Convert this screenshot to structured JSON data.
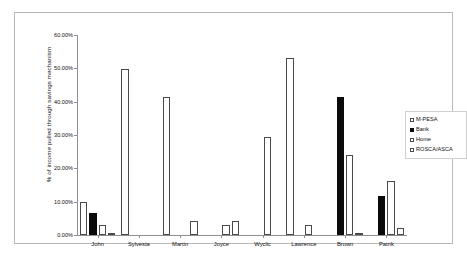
{
  "chart_data": {
    "type": "bar",
    "title": "",
    "xlabel": "",
    "ylabel": "% of income pulled through savings mechanism",
    "ylim": [
      0,
      60
    ],
    "ytick_labels": [
      "0.00%",
      "10.00%",
      "20.00%",
      "30.00%",
      "40.00%",
      "50.00%",
      "60.00%"
    ],
    "ytick_values": [
      0,
      10,
      20,
      30,
      40,
      50,
      60
    ],
    "grid": false,
    "legend_position": "right",
    "categories": [
      "John",
      "Sylvesta",
      "Martin",
      "Joyce",
      "Wyclic",
      "Lawrence",
      "Brown",
      "Patrik"
    ],
    "series": [
      {
        "name": "M-PESA",
        "style": "open",
        "values": [
          10.0,
          49.7,
          41.3,
          0,
          0,
          53.0,
          0,
          0
        ]
      },
      {
        "name": "Bank",
        "style": "filled",
        "values": [
          6.5,
          0,
          0,
          0,
          0,
          0,
          41.3,
          11.6
        ]
      },
      {
        "name": "Home",
        "style": "open",
        "values": [
          3.1,
          0,
          0,
          3.0,
          29.3,
          3.0,
          24.0,
          16.2
        ]
      },
      {
        "name": "ROSCA/ASCA",
        "style": "open",
        "values": [
          0.4,
          0,
          4.3,
          4.3,
          0,
          0,
          0.3,
          2.0
        ]
      }
    ]
  },
  "legend": {
    "items": [
      {
        "label": "M-PESA",
        "style": "open"
      },
      {
        "label": "Bank",
        "style": "filled"
      },
      {
        "label": "Home",
        "style": "open"
      },
      {
        "label": "ROSCA/ASCA",
        "style": "open"
      }
    ]
  },
  "colors": {
    "open_fill": "#ffffff",
    "open_stroke": "#4a4a4a",
    "filled": "#0a0a0a",
    "axis": "#8f8f8f",
    "frame": "#b9b9b9",
    "text": "#111111",
    "background": "#ffffff"
  }
}
